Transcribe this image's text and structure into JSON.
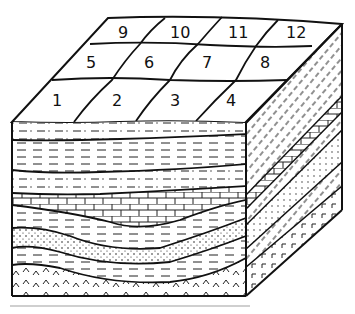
{
  "figure": {
    "type": "geological block diagram",
    "grid_labels": [
      "1",
      "2",
      "3",
      "4",
      "5",
      "6",
      "7",
      "8",
      "9",
      "10",
      "11",
      "12"
    ],
    "grid_rows": [
      [
        "9",
        "10",
        "11",
        "12"
      ],
      [
        "5",
        "6",
        "7",
        "8"
      ],
      [
        "1",
        "2",
        "3",
        "4"
      ]
    ],
    "strata_top_to_bottom": [
      "dash-dot pattern (siltstone)",
      "dashed pattern (shale)",
      "dash-dot pattern (siltstone)",
      "brick pattern (limestone)",
      "dashed pattern (shale)",
      "dotted pattern (sandstone)",
      "dashed pattern (shale)",
      "caret pattern (igneous basement)"
    ],
    "caption": "",
    "colors": {
      "ink": "#111111",
      "background": "#ffffff"
    }
  }
}
